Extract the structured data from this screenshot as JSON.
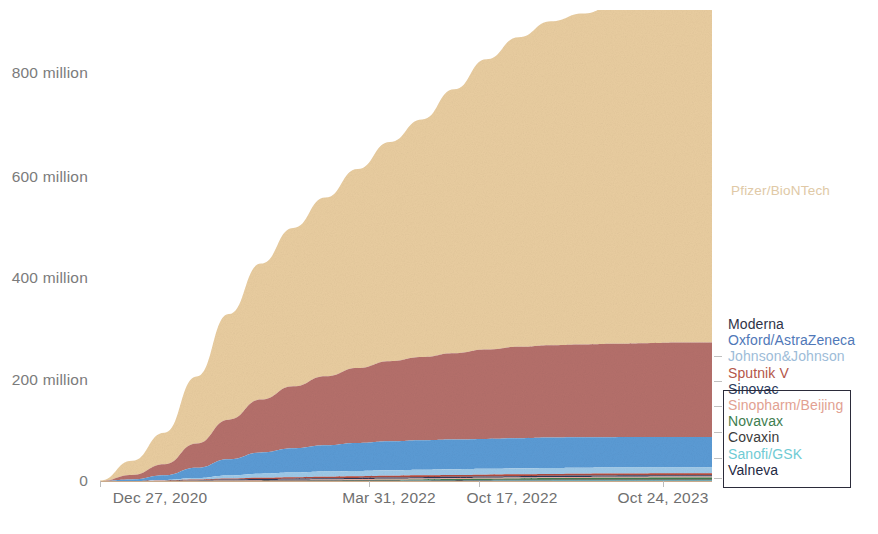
{
  "chart_data": {
    "type": "area",
    "title": "",
    "subtitle": "",
    "xlabel": "",
    "ylabel": "",
    "stacked": true,
    "grid": false,
    "legend_position": "right",
    "ylim": [
      0,
      900000000
    ],
    "y_ticks": [
      0,
      200000000,
      400000000,
      600000000,
      800000000
    ],
    "y_tick_labels": [
      "0",
      "200 million",
      "400 million",
      "600 million",
      "800 million"
    ],
    "x_tick_labels": [
      "Dec 27, 2020",
      "Mar 31, 2022",
      "Oct 17, 2022",
      "Oct 24, 2023"
    ],
    "x_tick_positions": [
      0.0,
      0.44,
      0.62,
      0.92
    ],
    "x": [
      "Dec 27, 2020",
      "Feb 2021",
      "Mar 2021",
      "Apr 2021",
      "May 2021",
      "Jun 2021",
      "Jul 2021",
      "Aug 2021",
      "Sep 2021",
      "Oct 2021",
      "Nov 2021",
      "Dec 2021",
      "Jan 2022",
      "Mar 31, 2022",
      "Jun 2022",
      "Oct 17, 2022",
      "Feb 2023",
      "Jun 2023",
      "Oct 24, 2023",
      "Dec 2023"
    ],
    "series": [
      {
        "name": "Pfizer/BioNTech",
        "color": "#e9cda0",
        "values": [
          1000000,
          28000000,
          62000000,
          132000000,
          208000000,
          268000000,
          312000000,
          352000000,
          392000000,
          432000000,
          468000000,
          520000000,
          572000000,
          610000000,
          638000000,
          652000000,
          668000000,
          678000000,
          686000000,
          690000000
        ]
      },
      {
        "name": "Moderna",
        "color": "#b5706b",
        "values": [
          0,
          9000000,
          22000000,
          48000000,
          78000000,
          104000000,
          122000000,
          136000000,
          148000000,
          158000000,
          164000000,
          170000000,
          176000000,
          180000000,
          182000000,
          183000000,
          184000000,
          185000000,
          186000000,
          186000000
        ]
      },
      {
        "name": "Oxford/AstraZeneca",
        "color": "#5b9bd5",
        "values": [
          0,
          3000000,
          9000000,
          20000000,
          32000000,
          42000000,
          48000000,
          52000000,
          55000000,
          57000000,
          58000000,
          58500000,
          59000000,
          59500000,
          60000000,
          60000000,
          60000000,
          60000000,
          60000000,
          60000000
        ]
      },
      {
        "name": "Johnson&Johnson",
        "color": "#9ec9e8",
        "values": [
          0,
          0,
          1000000,
          3000000,
          6000000,
          8000000,
          9000000,
          10000000,
          10500000,
          11000000,
          11200000,
          11400000,
          11500000,
          11600000,
          11700000,
          11700000,
          11700000,
          11700000,
          11700000,
          11700000
        ]
      },
      {
        "name": "Sputnik V",
        "color": "#b04a3e",
        "values": [
          0,
          0,
          500000,
          1200000,
          2000000,
          2600000,
          3000000,
          3200000,
          3400000,
          3500000,
          3600000,
          3600000,
          3700000,
          3700000,
          3700000,
          3700000,
          3700000,
          3700000,
          3700000,
          3700000
        ]
      },
      {
        "name": "Sinovac",
        "color": "#2b3a5c",
        "values": [
          0,
          0,
          300000,
          800000,
          1400000,
          1800000,
          2100000,
          2300000,
          2400000,
          2500000,
          2600000,
          2600000,
          2600000,
          2700000,
          2700000,
          2700000,
          2700000,
          2700000,
          2700000,
          2700000
        ]
      },
      {
        "name": "Sinopharm/Beijing",
        "color": "#e8a89a",
        "values": [
          0,
          0,
          200000,
          600000,
          1000000,
          1300000,
          1500000,
          1600000,
          1700000,
          1800000,
          1800000,
          1900000,
          1900000,
          1900000,
          1900000,
          1900000,
          1900000,
          1900000,
          1900000,
          1900000
        ]
      },
      {
        "name": "Novavax",
        "color": "#3e7d4f",
        "values": [
          0,
          0,
          0,
          0,
          0,
          0,
          200000,
          500000,
          900000,
          1300000,
          1600000,
          1900000,
          2200000,
          2600000,
          3000000,
          3200000,
          3400000,
          3500000,
          3600000,
          3600000
        ]
      },
      {
        "name": "Covaxin",
        "color": "#3b3b3b",
        "values": [
          0,
          0,
          100000,
          300000,
          500000,
          700000,
          800000,
          900000,
          1000000,
          1000000,
          1100000,
          1100000,
          1100000,
          1100000,
          1100000,
          1100000,
          1100000,
          1100000,
          1100000,
          1100000
        ]
      },
      {
        "name": "Sanofi/GSK",
        "color": "#6fcbd4",
        "values": [
          0,
          0,
          0,
          0,
          0,
          0,
          0,
          0,
          0,
          100000,
          300000,
          500000,
          700000,
          900000,
          1100000,
          1200000,
          1300000,
          1300000,
          1400000,
          1400000
        ]
      },
      {
        "name": "Valneva",
        "color": "#1f2a44",
        "values": [
          0,
          0,
          0,
          0,
          0,
          0,
          0,
          0,
          0,
          0,
          100000,
          200000,
          300000,
          400000,
          500000,
          600000,
          600000,
          700000,
          700000,
          700000
        ]
      }
    ],
    "annotations": [
      {
        "text": "Pfizer/BioNTech",
        "color": "#e0c9a6",
        "x_frac": 1.02,
        "y_value": 610000000
      }
    ]
  },
  "legend": {
    "items": [
      {
        "label": "Moderna",
        "color": "#2f3448"
      },
      {
        "label": "Oxford/AstraZeneca",
        "color": "#4f78b8"
      },
      {
        "label": "Johnson&Johnson",
        "color": "#9dbcd8"
      },
      {
        "label": "Sputnik V",
        "color": "#b4564a"
      },
      {
        "label": "Sinovac",
        "color": "#2b3a5c"
      },
      {
        "label": "Sinopharm/Beijing",
        "color": "#e2a192"
      },
      {
        "label": "Novavax",
        "color": "#3e7d4f"
      },
      {
        "label": "Covaxin",
        "color": "#3b3b3b"
      },
      {
        "label": "Sanofi/GSK",
        "color": "#6fcbd4"
      },
      {
        "label": "Valneva",
        "color": "#1f2a44"
      }
    ]
  }
}
